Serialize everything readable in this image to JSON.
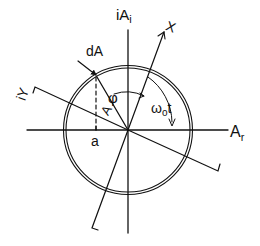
{
  "diagram": {
    "type": "phasor-rotation",
    "labels": {
      "imag_axis": "iA",
      "imag_axis_sub": "i",
      "real_axis": "A",
      "real_axis_sub": "r",
      "rotated_x": "X",
      "rotated_y": "iY",
      "differential": "dA",
      "amplitude": "A",
      "angle_phi": "φ",
      "angle_omega": "ω",
      "angle_omega_sub": "o",
      "angle_omega_t": "t",
      "projection": "a"
    },
    "colors": {
      "stroke": "#111111",
      "background": "#ffffff"
    }
  }
}
